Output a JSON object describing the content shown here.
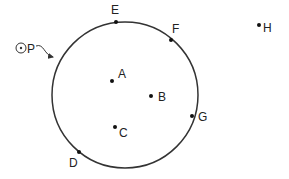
{
  "diagram": {
    "type": "circle-geometry",
    "circle": {
      "name": "P",
      "label": "⊙P",
      "cx": 125,
      "cy": 95,
      "r": 73,
      "stroke": "#333333"
    },
    "points": [
      {
        "name": "A",
        "label": "A",
        "x": 112,
        "y": 81,
        "lx": 118,
        "ly": 78,
        "position": "interior"
      },
      {
        "name": "B",
        "label": "B",
        "x": 151,
        "y": 96,
        "lx": 158,
        "ly": 101,
        "position": "interior"
      },
      {
        "name": "C",
        "label": "C",
        "x": 115,
        "y": 127,
        "lx": 119,
        "ly": 137,
        "position": "interior"
      },
      {
        "name": "D",
        "label": "D",
        "x": 79,
        "y": 152,
        "lx": 69,
        "ly": 167,
        "position": "on-circle"
      },
      {
        "name": "E",
        "label": "E",
        "x": 116,
        "y": 22,
        "lx": 111,
        "ly": 14,
        "position": "on-circle"
      },
      {
        "name": "F",
        "label": "F",
        "x": 171,
        "y": 40,
        "lx": 172,
        "ly": 33,
        "position": "on-circle"
      },
      {
        "name": "G",
        "label": "G",
        "x": 192,
        "y": 116,
        "lx": 198,
        "ly": 121,
        "position": "on-circle"
      },
      {
        "name": "H",
        "label": "H",
        "x": 259,
        "y": 25,
        "lx": 263,
        "ly": 32,
        "position": "exterior"
      }
    ],
    "pointer": {
      "from": "⊙P",
      "to": "circle",
      "path": "M36 46 C44 43, 44 55, 53 57"
    }
  }
}
